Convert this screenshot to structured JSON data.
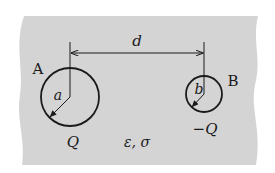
{
  "diagram": {
    "colors": {
      "background": "#ffffff",
      "medium": "#d4d4d4",
      "stroke": "#1a1a1a"
    },
    "medium": {
      "label": "ε, σ"
    },
    "separation": {
      "label": "d"
    },
    "sphere_a": {
      "name": "A",
      "radius_label": "a",
      "charge_label": "Q"
    },
    "sphere_b": {
      "name": "B",
      "radius_label": "b",
      "charge_label": "−Q"
    }
  }
}
